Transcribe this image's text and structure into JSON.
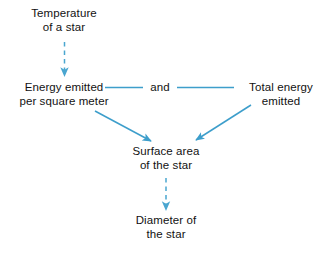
{
  "diagram": {
    "background_color": "#ffffff",
    "edge_color": "#3d9ecb",
    "text_color": "#121212",
    "nodes": {
      "temperature": {
        "line1": "Temperature",
        "line2": "of a star"
      },
      "energy_per_area": {
        "line1": "Energy emitted",
        "line2": "per square meter"
      },
      "conjunction": {
        "line1": "and",
        "line2": ""
      },
      "total_energy": {
        "line1": "Total energy",
        "line2": "emitted"
      },
      "surface_area": {
        "line1": "Surface area",
        "line2": "of the star"
      },
      "diameter": {
        "line1": "Diameter of",
        "line2": "the star"
      }
    },
    "edges": [
      {
        "name": "temperature-to-energy-per-area",
        "style": "dashed",
        "arrow": true,
        "from": "temperature",
        "to": "energy_per_area"
      },
      {
        "name": "energy-per-area-to-and",
        "style": "solid",
        "arrow": false,
        "from": "energy_per_area",
        "to": "conjunction"
      },
      {
        "name": "and-to-total-energy",
        "style": "solid",
        "arrow": false,
        "from": "conjunction",
        "to": "total_energy"
      },
      {
        "name": "energy-per-area-to-surface-area",
        "style": "solid",
        "arrow": true,
        "from": "energy_per_area",
        "to": "surface_area"
      },
      {
        "name": "total-energy-to-surface-area",
        "style": "solid",
        "arrow": true,
        "from": "total_energy",
        "to": "surface_area"
      },
      {
        "name": "surface-area-to-diameter",
        "style": "dashed",
        "arrow": true,
        "from": "surface_area",
        "to": "diameter"
      }
    ]
  }
}
